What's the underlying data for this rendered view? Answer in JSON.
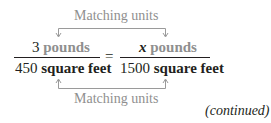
{
  "top_label": "Matching units",
  "bottom_label": "Matching units",
  "left_fraction": {
    "numerator_value": "3",
    "numerator_unit": "pounds",
    "denominator_value": "450",
    "denominator_unit": "square feet"
  },
  "equals": "=",
  "right_fraction": {
    "numerator_value": "x",
    "numerator_unit": "pounds",
    "denominator_value": "1500",
    "denominator_unit": "square feet"
  },
  "continued": "(continued)",
  "colors": {
    "text": "#231f20",
    "highlight_gray": "#8f8f8f"
  }
}
